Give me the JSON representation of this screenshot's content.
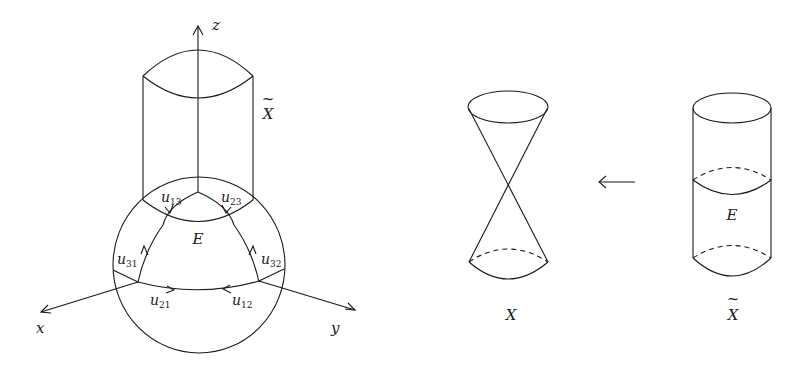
{
  "left_figure": {
    "axes": {
      "x": "x",
      "y": "y",
      "z": "z"
    },
    "surface_label": {
      "base": "X",
      "accent": "~"
    },
    "exceptional_divisor_label": "E",
    "chart_labels": [
      {
        "base": "u",
        "sub": "13"
      },
      {
        "base": "u",
        "sub": "23"
      },
      {
        "base": "u",
        "sub": "31"
      },
      {
        "base": "u",
        "sub": "32"
      },
      {
        "base": "u",
        "sub": "21"
      },
      {
        "base": "u",
        "sub": "12"
      }
    ]
  },
  "right_figure": {
    "cone_label": "X",
    "map_arrow": "←",
    "resolution_label": {
      "base": "X",
      "accent": "~"
    },
    "exceptional_divisor_label": "E"
  }
}
